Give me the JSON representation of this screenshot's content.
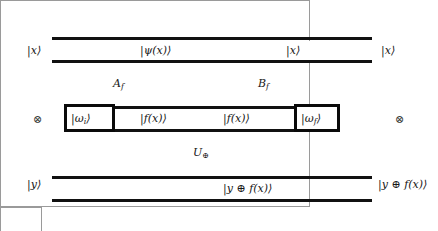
{
  "figure": {
    "type": "quantum-circuit-diagram"
  },
  "input_register": {
    "top_label": "|x⟩",
    "tensor_symbol": "⊗",
    "bottom_label": "|y⟩"
  },
  "output_register": {
    "top_label": "|x⟩",
    "tensor_symbol": "⊗",
    "bottom_label": "|y ⊕ f(x)⟩"
  },
  "gates": [
    {
      "name": "A_f",
      "base": "A",
      "subscript": "f"
    },
    {
      "name": "B_f",
      "base": "B",
      "subscript": "f"
    },
    {
      "name": "U_oplus",
      "base": "U",
      "subscript": "⊕"
    }
  ],
  "wire_labels": {
    "psi_x": "|ψ(x)⟩",
    "x_after_b": "|x⟩",
    "omega_i": "|ω",
    "omega_i_sub": "i",
    "omega_i_close": "⟩",
    "omega_f": "|ω",
    "omega_f_sub": "f",
    "omega_f_close": "⟩",
    "f_x_left": "|f(x)⟩",
    "f_x_right": "|f(x)⟩",
    "y_xor_f_x": "|y ⊕ f(x)⟩"
  },
  "colors": {
    "wire": "#111111",
    "box_border": "#9a9a9a",
    "thick_border": "#0a0a0a",
    "text": "#161616",
    "background": "#ffffff"
  }
}
